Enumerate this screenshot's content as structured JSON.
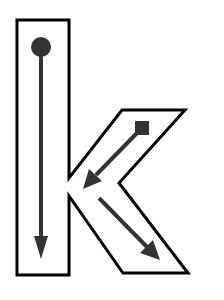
{
  "diagram": {
    "letter": "k",
    "colors": {
      "outline": "#000000",
      "strokes": "#333333",
      "background": "#ffffff"
    },
    "strokes": [
      {
        "order": 1,
        "start_marker": "circle",
        "direction": "down",
        "from": [
          41,
          47
        ],
        "to": [
          41,
          258
        ]
      },
      {
        "order": 2,
        "start_marker": "square",
        "direction": "down-left",
        "from": [
          142,
          128
        ],
        "to": [
          83,
          188
        ]
      },
      {
        "order": 3,
        "start_marker": "none",
        "direction": "down-right",
        "from": [
          98,
          198
        ],
        "to": [
          160,
          260
        ]
      }
    ]
  }
}
